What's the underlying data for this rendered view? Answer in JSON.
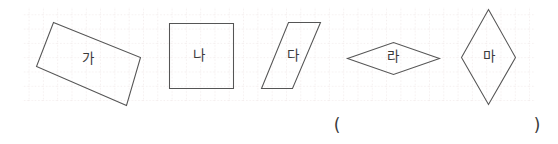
{
  "figure": {
    "background_color": "#ffffff",
    "stroke_color": "#555555",
    "label_color": "#3a3a3a",
    "grid": {
      "color": "#e8dede",
      "cell_size_px": 14.3,
      "style": "dotted",
      "x": 22,
      "y": 7,
      "width": 513,
      "height": 95
    },
    "shapes": [
      {
        "label": "가",
        "type": "rotated-rectangle",
        "points": "53.5,22.5 140.5,57.5 126.5,105.5 36.5,66.5",
        "label_x": 88,
        "label_y": 59
      },
      {
        "label": "나",
        "type": "square",
        "points": "169.5,23.5 233.5,23.5 233.5,88.5 169.5,88.5",
        "label_x": 199,
        "label_y": 56
      },
      {
        "label": "다",
        "type": "parallelogram",
        "points": "288.5,22.5 320.5,22.5 292.5,88.5 261.5,88.5",
        "label_x": 293,
        "label_y": 56
      },
      {
        "label": "라",
        "type": "rhombus-wide",
        "points": "347.5,58.5 393.5,42.5 439.5,58.5 393.5,74.5",
        "label_x": 393,
        "label_y": 57
      },
      {
        "label": "마",
        "type": "rhombus-tall",
        "points": "488.5,9.5 515.5,57.5 488.5,104.5 461.5,57.5",
        "label_x": 489,
        "label_y": 57
      }
    ],
    "answer_field": {
      "open_paren": "(",
      "close_paren": ")",
      "open_x": 337,
      "close_x": 537,
      "y": 126
    }
  }
}
